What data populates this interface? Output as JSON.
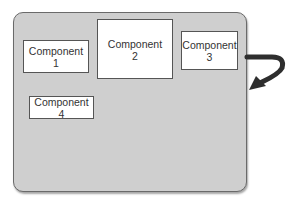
{
  "diagram": {
    "container": {
      "fill": "#cfcfcf",
      "border": "#6a6a6a"
    },
    "components": [
      {
        "label": "Component",
        "number": "1"
      },
      {
        "label": "Component",
        "number": "2"
      },
      {
        "label": "Component",
        "number": "3"
      },
      {
        "label": "Component",
        "number": "4"
      }
    ],
    "arrow": {
      "color": "#333333",
      "from": "component-3",
      "direction": "exits right edge, curves back into container"
    }
  }
}
